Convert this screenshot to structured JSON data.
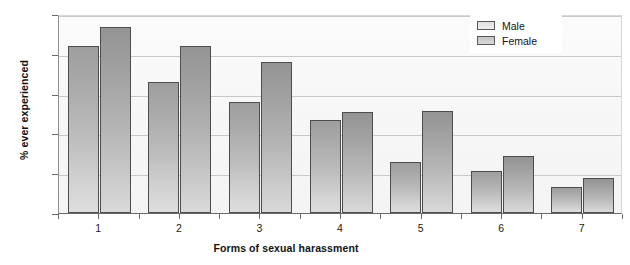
{
  "chart_data": {
    "type": "bar",
    "title": "",
    "xlabel": "Forms of sexual harassment",
    "ylabel": "% ever experienced",
    "categories": [
      "1",
      "2",
      "3",
      "4",
      "5",
      "6",
      "7"
    ],
    "series": [
      {
        "name": "Male",
        "values": [
          84,
          66,
          56,
          46.5,
          25.5,
          21,
          13
        ]
      },
      {
        "name": "Female",
        "values": [
          93.5,
          84,
          76,
          51,
          51.5,
          28.5,
          17.5
        ]
      }
    ],
    "ylim": [
      0,
      100
    ],
    "yticks": [
      0,
      20,
      40,
      60,
      80,
      100
    ],
    "ytick_labels": [
      "0",
      "20",
      "40",
      "60",
      "80",
      "100"
    ],
    "grid": true,
    "legend_position": "top-right",
    "colors": {
      "male": "#bdbdbd",
      "female": "#b0b0b0",
      "bar_outline": "#4d4d4d",
      "gridline": "#c9c9c9",
      "axis": "#6a6a6a",
      "plot_background": "#f7f7f7",
      "text": "#131313"
    }
  },
  "legend": {
    "entries": [
      {
        "label": "Male"
      },
      {
        "label": "Female"
      }
    ]
  }
}
